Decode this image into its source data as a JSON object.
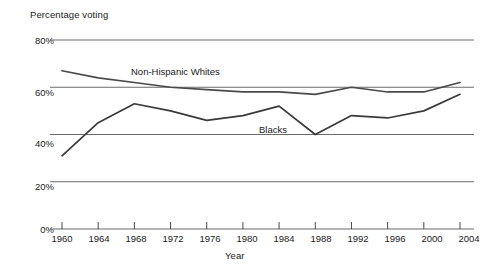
{
  "chart_data": {
    "type": "line",
    "title": "",
    "ylabel": "Percentage voting",
    "xlabel": "Year",
    "grid": true,
    "legend_position": "inline-annotations",
    "x": [
      1960,
      1964,
      1968,
      1972,
      1976,
      1980,
      1984,
      1988,
      1992,
      1996,
      2000,
      2004
    ],
    "categories": [
      "1960",
      "1964",
      "1968",
      "1972",
      "1976",
      "1980",
      "1984",
      "1988",
      "1992",
      "1996",
      "2000",
      "2004"
    ],
    "xlim": [
      1960,
      2004
    ],
    "ylim": [
      0,
      80
    ],
    "y_ticks": [
      0,
      20,
      40,
      60,
      80
    ],
    "y_tick_labels": [
      "0%",
      "20%",
      "40%",
      "60%",
      "80%"
    ],
    "series": [
      {
        "name": "Non-Hispanic Whites",
        "color": "#4a4a4a",
        "values": [
          67,
          64,
          62,
          60,
          59,
          58,
          58,
          57,
          60,
          58,
          58,
          62
        ]
      },
      {
        "name": "Blacks",
        "color": "#3a3a3a",
        "values": [
          31,
          45,
          53,
          50,
          46,
          48,
          52,
          40,
          48,
          47,
          50,
          57
        ]
      }
    ]
  },
  "axes": {
    "y_title": "Percentage voting",
    "x_title": "Year",
    "y_labels": [
      "80%",
      "60%",
      "40%",
      "20%",
      "0%"
    ],
    "x_labels": [
      "1960",
      "1964",
      "1968",
      "1972",
      "1976",
      "1980",
      "1984",
      "1988",
      "1992",
      "1996",
      "2000",
      "2004"
    ]
  },
  "annotations": {
    "whites_label": "Non-Hispanic Whites",
    "blacks_label": "Blacks"
  },
  "colors": {
    "background": "#ffffff",
    "gridline": "#6b6b6b",
    "axis": "#4a4a4a",
    "text": "#1a1a1a",
    "series_whites": "#4a4a4a",
    "series_blacks": "#3a3a3a"
  }
}
